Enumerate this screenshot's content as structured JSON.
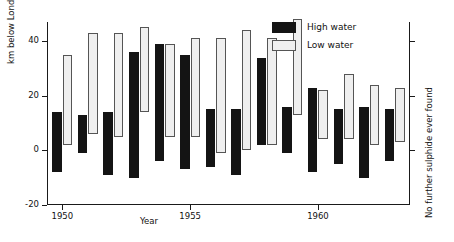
{
  "chart_data": {
    "type": "bar",
    "title": "",
    "xlabel": "Year",
    "ylabel": "km below London Bridge",
    "right_label": "No further sulphide ever found",
    "grid": false,
    "legend_position": "top-right",
    "ylim": [
      -20,
      47
    ],
    "yticks": [
      -20,
      0,
      20,
      40
    ],
    "ytick_labels": [
      "-20",
      "0",
      "20",
      "40"
    ],
    "xlim": [
      1949.4,
      1963.6
    ],
    "xticks": [
      1950,
      1955,
      1960
    ],
    "xtick_labels": [
      "1950",
      "1955",
      "1960"
    ],
    "categories": [
      1950,
      1951,
      1952,
      1953,
      1954,
      1955,
      1956,
      1957,
      1958,
      1959,
      1960,
      1961,
      1962,
      1963
    ],
    "note": "Each year shows the vertical extent (from downstream to upstream km below London Bridge) of the zone, as a floating bar for high water and for low water.",
    "series": [
      {
        "name": "High water",
        "key": "high",
        "type": "range-bar",
        "top_values": [
          14,
          13,
          14,
          36,
          39,
          35,
          15,
          15,
          34,
          16,
          23,
          15,
          16,
          15
        ],
        "bottom_values": [
          -8,
          -1,
          -9,
          -10,
          -4,
          -7,
          -6,
          -9,
          2,
          -1,
          -8,
          -5,
          -10,
          -4
        ]
      },
      {
        "name": "Low water",
        "key": "low",
        "type": "range-bar",
        "top_values": [
          35,
          43,
          43,
          45,
          39,
          41,
          41,
          44,
          41,
          48,
          22,
          28,
          24,
          23
        ],
        "bottom_values": [
          2,
          6,
          5,
          14,
          5,
          5,
          -1,
          0,
          2,
          13,
          4,
          4,
          2,
          3
        ]
      }
    ]
  },
  "legend": {
    "items": [
      {
        "label": "High water",
        "key": "high",
        "color": "#141414"
      },
      {
        "label": "Low water",
        "key": "low",
        "color": "#efefef"
      }
    ]
  },
  "colors": {
    "high_water": "#141414",
    "low_water": "#efefef",
    "axis": "#1a1a1a",
    "background": "#ffffff"
  }
}
